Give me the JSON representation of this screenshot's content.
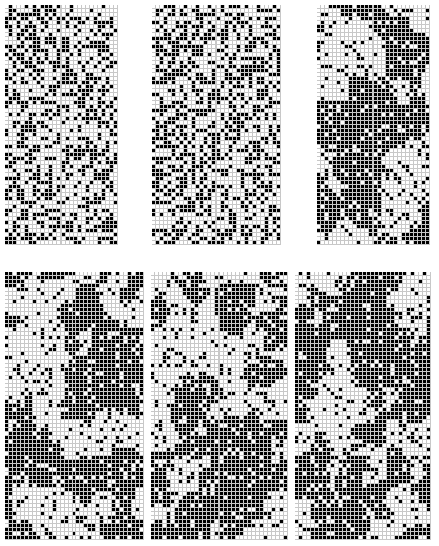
{
  "figure": {
    "title": "",
    "background_color": "#ffffff",
    "width": 439,
    "height": 546,
    "layout": {
      "rows": 2,
      "cols": 3
    }
  },
  "chart_data": {
    "type": "heatmap",
    "title": "",
    "subtitle": "",
    "xlabel": "",
    "ylabel": "",
    "grid": true,
    "legend_position": "none",
    "colormap": {
      "0": "#ffffff",
      "1": "#000000",
      "gridline": "#c8c8c8"
    },
    "value_labels": {
      "0": "white / inactive",
      "1": "black / active"
    },
    "panel_grid": {
      "rows": 2,
      "cols": 3
    },
    "cell_size_px": 4,
    "panels": [
      {
        "id": "panel-top-left",
        "label": "",
        "row": 0,
        "col": 0,
        "x": 5,
        "y": 5,
        "width": 113,
        "height": 240,
        "cols": 28,
        "rows": 60,
        "density": 0.44,
        "pattern": "random-speckle",
        "seed": 11,
        "structure": "uniform noise, slight clustering in lower half"
      },
      {
        "id": "panel-top-middle",
        "label": "",
        "row": 0,
        "col": 1,
        "x": 152,
        "y": 5,
        "width": 129,
        "height": 240,
        "cols": 32,
        "rows": 60,
        "density": 0.46,
        "pattern": "random-speckle",
        "seed": 23,
        "structure": "uniform noise, fine checkered texture"
      },
      {
        "id": "panel-top-right",
        "label": "",
        "row": 0,
        "col": 2,
        "x": 317,
        "y": 5,
        "width": 113,
        "height": 240,
        "cols": 28,
        "rows": 60,
        "density": 0.58,
        "pattern": "clustered-blobs",
        "seed": 37,
        "structure": "coarse blobs and diagonal streaks, darker overall"
      },
      {
        "id": "panel-bottom-left",
        "label": "",
        "row": 1,
        "col": 0,
        "x": 5,
        "y": 272,
        "width": 139,
        "height": 268,
        "cols": 35,
        "rows": 67,
        "density": 0.52,
        "pattern": "clustered-blobs",
        "seed": 53,
        "structure": "medium clusters, vertical banding on right edge"
      },
      {
        "id": "panel-bottom-middle",
        "label": "",
        "row": 1,
        "col": 1,
        "x": 151,
        "y": 272,
        "width": 137,
        "height": 268,
        "cols": 34,
        "rows": 67,
        "density": 0.54,
        "pattern": "clustered-blobs",
        "seed": 71,
        "structure": "irregular patches, horizontal striping mid-panel"
      },
      {
        "id": "panel-bottom-right",
        "label": "",
        "row": 1,
        "col": 2,
        "x": 295,
        "y": 272,
        "width": 136,
        "height": 268,
        "cols": 34,
        "rows": 67,
        "density": 0.6,
        "pattern": "clustered-blobs",
        "seed": 89,
        "structure": "large dark regions with bright diagonal channel at left"
      }
    ]
  }
}
